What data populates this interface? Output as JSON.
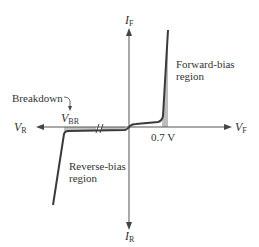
{
  "diagram": {
    "type": "diode-iv-characteristic",
    "axes": {
      "y_positive": {
        "symbol": "I",
        "subscript": "F"
      },
      "y_negative": {
        "symbol": "I",
        "subscript": "R"
      },
      "x_positive": {
        "symbol": "V",
        "subscript": "F"
      },
      "x_negative": {
        "symbol": "V",
        "subscript": "R"
      }
    },
    "labels": {
      "forward_region_line1": "Forward-bias",
      "forward_region_line2": "region",
      "reverse_region_line1": "Reverse-bias",
      "reverse_region_line2": "region",
      "breakdown": "Breakdown",
      "vbr_symbol": "V",
      "vbr_subscript": "BR",
      "knee_voltage": "0.7 V"
    },
    "colors": {
      "curve": "#3a3a3a",
      "axis": "#555555",
      "shading": "#b8b8b8",
      "text": "#333333"
    }
  }
}
